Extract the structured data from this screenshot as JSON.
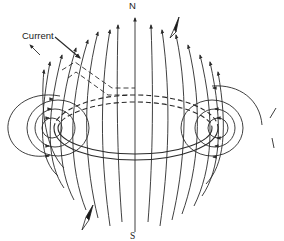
{
  "diagram": {
    "labels": {
      "current": "Current",
      "north": "N",
      "south": "S"
    },
    "colors": {
      "line": "#2a2a2a",
      "background": "#ffffff",
      "needle_fill": "#1a1a1a"
    },
    "elements": [
      "current-loop",
      "lead-wires",
      "field-lines",
      "compass-needle-north",
      "compass-needle-south"
    ]
  }
}
